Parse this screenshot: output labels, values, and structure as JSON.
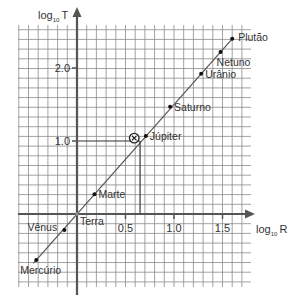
{
  "chart_data": {
    "type": "scatter",
    "title": "",
    "xlabel": "log10 R",
    "ylabel": "log10 T",
    "xlabel_main": "log",
    "xlabel_sub": "10",
    "xlabel_var": "R",
    "ylabel_main": "log",
    "ylabel_sub": "10",
    "ylabel_var": "T",
    "xlim": [
      -0.6,
      1.8
    ],
    "ylim": [
      -1.0,
      2.5
    ],
    "grid": true,
    "x_ticks": [
      {
        "value": 0.5,
        "label": "0.5"
      },
      {
        "value": 1.0,
        "label": "1.0"
      },
      {
        "value": 1.5,
        "label": "1.5"
      }
    ],
    "y_ticks": [
      {
        "value": 1.0,
        "label": "1.0"
      },
      {
        "value": 2.0,
        "label": "2.0"
      }
    ],
    "series": [
      {
        "name": "Planetas",
        "points": [
          {
            "label": "Mercúrio",
            "x": -0.42,
            "y": -0.63
          },
          {
            "label": "Vênus",
            "x": -0.13,
            "y": -0.22
          },
          {
            "label": "Terra",
            "x": 0.0,
            "y": 0.0
          },
          {
            "label": "Marte",
            "x": 0.18,
            "y": 0.27
          },
          {
            "label": "Júpiter",
            "x": 0.71,
            "y": 1.07
          },
          {
            "label": "Saturno",
            "x": 0.96,
            "y": 1.47
          },
          {
            "label": "Urânio",
            "x": 1.28,
            "y": 1.92
          },
          {
            "label": "Netuno",
            "x": 1.48,
            "y": 2.22
          },
          {
            "label": "Plutão",
            "x": 1.6,
            "y": 2.4
          }
        ]
      }
    ],
    "fit_line": {
      "slope": 1.5,
      "intercept": 0.0,
      "x_start": -0.45,
      "x_end": 1.6
    },
    "annotations": [
      {
        "type": "circled-x-marker",
        "x": 0.59,
        "y": 1.04
      },
      {
        "type": "guide-lines",
        "x": 0.65,
        "y": 1.0
      }
    ]
  }
}
